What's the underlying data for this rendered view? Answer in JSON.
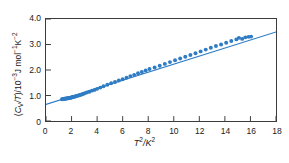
{
  "figure": {
    "background_color": "#ffffff",
    "frame_color": "#3c3c3c"
  },
  "axes": {
    "y_title_prefix": "(",
    "y_title_c": "C",
    "y_title_v": "V",
    "y_title_slash_t": "/T",
    "y_title_close": ")/10",
    "y_title_exp": "−3",
    "y_title_units": "J mol",
    "y_title_units_exp1": "−1",
    "y_title_units_k": "K",
    "y_title_units_exp2": "−2",
    "y_title_full": "(CV/T)/10−3J mol−1K−2",
    "x_title_t": "T",
    "x_title_t_exp": "2",
    "x_title_slash_k": "/K",
    "x_title_k_exp": "2",
    "x_title_full": "T2/K2",
    "y_ticks": [
      "0",
      "1.0",
      "2.0",
      "3.0",
      "4.0"
    ],
    "y_tick_values": [
      0,
      1.0,
      2.0,
      3.0,
      4.0
    ],
    "x_ticks": [
      "0",
      "2",
      "4",
      "6",
      "8",
      "10",
      "12",
      "14",
      "16",
      "18"
    ],
    "x_tick_values": [
      0,
      2,
      4,
      6,
      8,
      10,
      12,
      14,
      16,
      18
    ]
  },
  "chart_data": {
    "type": "scatter",
    "title": "",
    "subtitle": "",
    "xlabel": "T2/K2",
    "ylabel": "(CV/T)/10−3J mol−1K−2",
    "xlim": [
      0,
      18
    ],
    "ylim": [
      0,
      4.0
    ],
    "grid": false,
    "legend": null,
    "marker_color": "#2e7cc4",
    "line_color": "#2e7cc4",
    "marker_size": 2.0,
    "line_width": 1.1,
    "fit_line": {
      "type": "line",
      "intercept": 0.65,
      "slope": 0.158,
      "x_start": 0,
      "y_start": 0.65,
      "x_end": 18,
      "y_end": 3.49
    },
    "series": [
      {
        "name": "heat capacity data",
        "x": [
          1.25,
          1.32,
          1.38,
          1.44,
          1.5,
          1.56,
          1.62,
          1.68,
          1.74,
          1.8,
          1.86,
          1.92,
          1.98,
          2.05,
          2.12,
          2.2,
          2.3,
          2.42,
          2.55,
          2.7,
          2.85,
          3.0,
          3.2,
          3.4,
          3.6,
          3.8,
          4.0,
          4.25,
          4.5,
          4.8,
          5.1,
          5.4,
          5.7,
          6.0,
          6.3,
          6.6,
          6.9,
          7.2,
          7.5,
          7.8,
          8.1,
          8.5,
          8.9,
          9.3,
          9.7,
          10.1,
          10.5,
          10.9,
          11.3,
          11.7,
          12.1,
          12.5,
          12.9,
          13.3,
          13.7,
          14.1,
          14.5,
          14.9,
          15.1,
          15.35,
          15.6,
          15.85,
          16.05
        ],
        "y": [
          0.85,
          0.86,
          0.86,
          0.87,
          0.87,
          0.88,
          0.88,
          0.89,
          0.89,
          0.9,
          0.9,
          0.91,
          0.92,
          0.93,
          0.94,
          0.95,
          0.96,
          0.98,
          1.0,
          1.02,
          1.05,
          1.08,
          1.12,
          1.15,
          1.19,
          1.22,
          1.26,
          1.31,
          1.36,
          1.42,
          1.48,
          1.53,
          1.59,
          1.64,
          1.7,
          1.76,
          1.81,
          1.87,
          1.92,
          1.98,
          2.04,
          2.1,
          2.17,
          2.24,
          2.31,
          2.38,
          2.45,
          2.52,
          2.59,
          2.66,
          2.73,
          2.8,
          2.87,
          2.94,
          3.0,
          3.07,
          3.14,
          3.2,
          3.26,
          3.22,
          3.28,
          3.3,
          3.31
        ]
      }
    ]
  }
}
